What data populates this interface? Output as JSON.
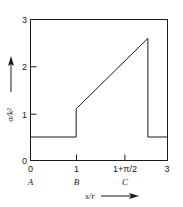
{
  "chart_data": {
    "type": "line",
    "title": "",
    "subtitle": "",
    "xlabel": "s/r",
    "ylabel": "σ/k²",
    "xlim": [
      0,
      3
    ],
    "ylim": [
      0,
      3
    ],
    "grid": false,
    "legend": null,
    "xticks": [
      {
        "value": 0,
        "label": "0",
        "point": "A"
      },
      {
        "value": 1,
        "label": "1",
        "point": "B"
      },
      {
        "value": 2.5708,
        "label": "1+π/2",
        "point": "C"
      },
      {
        "value": 3,
        "label": "3",
        "point": ""
      }
    ],
    "yticks": [
      {
        "value": 0,
        "label": "0"
      },
      {
        "value": 1,
        "label": "1"
      },
      {
        "value": 2,
        "label": "2"
      },
      {
        "value": 3,
        "label": "3"
      }
    ],
    "x": [
      0,
      1,
      1,
      2.5708,
      2.5708,
      3
    ],
    "y": [
      0.5,
      0.5,
      1.1,
      2.6,
      0.5,
      0.5
    ],
    "series": [
      {
        "name": "σ/k²",
        "points": [
          {
            "x": 0,
            "y": 0.5
          },
          {
            "x": 1,
            "y": 0.5
          },
          {
            "x": 1,
            "y": 1.1
          },
          {
            "x": 2.5708,
            "y": 2.6
          },
          {
            "x": 2.5708,
            "y": 0.5
          },
          {
            "x": 3,
            "y": 0.5
          }
        ]
      }
    ],
    "annotations": [
      {
        "text": "A",
        "x": 0,
        "role": "x-point-label"
      },
      {
        "text": "B",
        "x": 1,
        "role": "x-point-label"
      },
      {
        "text": "C",
        "x": 2.5708,
        "role": "x-point-label"
      }
    ],
    "axis_arrows": {
      "x": "right",
      "y": "up"
    },
    "colors": {
      "line": "#1a1a1a",
      "frame": "#1a1a1a",
      "background": "#ffffff"
    }
  },
  "labels": {
    "y_axis_title": "σ/k²",
    "x_axis_title": "s/r",
    "ytick_0": "0",
    "ytick_1": "1",
    "ytick_2": "2",
    "ytick_3": "3",
    "xtick_0": "0",
    "xtick_1": "1",
    "xtick_2": "1+π/2",
    "xtick_3": "3",
    "point_a": "A",
    "point_b": "B",
    "point_c": "C"
  }
}
